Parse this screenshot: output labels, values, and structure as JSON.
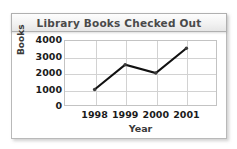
{
  "chart_data": {
    "type": "line",
    "title": "Library Books Checked Out",
    "xlabel": "Year",
    "ylabel": "Books",
    "categories": [
      "1998",
      "1999",
      "2000",
      "2001"
    ],
    "values": [
      1000,
      2500,
      2000,
      3500
    ],
    "series": [
      {
        "name": "Books Checked Out",
        "values": [
          1000,
          2500,
          2000,
          3500
        ]
      }
    ],
    "ylim": [
      0,
      4000
    ],
    "yticks": [
      0,
      1000,
      2000,
      3000,
      4000
    ],
    "ytick_labels": [
      "0",
      "1000",
      "2000",
      "3000",
      "4000"
    ],
    "xticks": [
      "1998",
      "1999",
      "2000",
      "2001"
    ],
    "grid": true,
    "legend": false,
    "legend_position": "none",
    "marker": "circle",
    "line_color": "#111111",
    "grid_color": "#d2d2d2",
    "plot_background": "#ffffff",
    "title_color": "#4a4a4a",
    "title_bar_color": "#f0f0f0"
  }
}
